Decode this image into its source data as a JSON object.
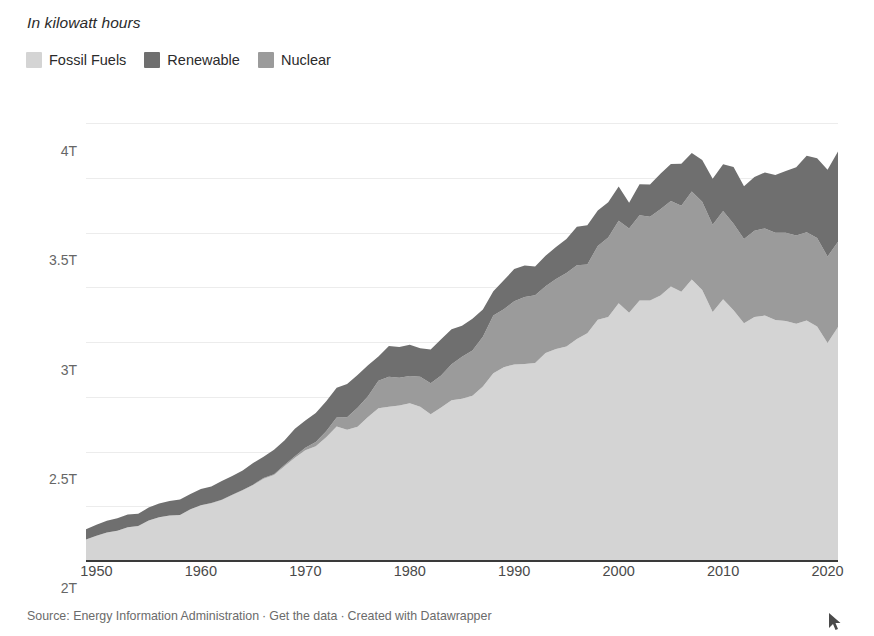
{
  "subtitle": "In kilowatt hours",
  "legend": {
    "items": [
      {
        "label": "Fossil Fuels",
        "color": "#d4d4d4"
      },
      {
        "label": "Renewable",
        "color": "#6f6f6f"
      },
      {
        "label": "Nuclear",
        "color": "#9b9b9b"
      }
    ]
  },
  "footer": {
    "source": "Source: Energy Information Administration",
    "sep1": "·",
    "get_data": "Get the data",
    "sep2": "·",
    "created": "Created with Datawrapper"
  },
  "cursor": {
    "name": "mouse-pointer"
  },
  "chart_data": {
    "type": "area",
    "stacked": true,
    "title": "",
    "subtitle": "In kilowatt hours",
    "xlabel": "",
    "ylabel": "",
    "xlim": [
      1949,
      2021
    ],
    "ylim": [
      0,
      4250000000000
    ],
    "grid": true,
    "legend_position": "top-left",
    "ytick_labels": [
      "0",
      "500B",
      "1T",
      "1.5T",
      "2T",
      "2.5T",
      "3T",
      "3.5T",
      "4T"
    ],
    "ytick_values": [
      0,
      500000000000,
      1000000000000,
      1500000000000,
      2000000000000,
      2500000000000,
      3000000000000,
      3500000000000,
      4000000000000
    ],
    "xtick_labels": [
      "1950",
      "1960",
      "1970",
      "1980",
      "1990",
      "2000",
      "2010",
      "2020"
    ],
    "xtick_values": [
      1950,
      1960,
      1970,
      1980,
      1990,
      2000,
      2010,
      2020
    ],
    "units": "kilowatt hours",
    "x": [
      1949,
      1950,
      1951,
      1952,
      1953,
      1954,
      1955,
      1956,
      1957,
      1958,
      1959,
      1960,
      1961,
      1962,
      1963,
      1964,
      1965,
      1966,
      1967,
      1968,
      1969,
      1970,
      1971,
      1972,
      1973,
      1974,
      1975,
      1976,
      1977,
      1978,
      1979,
      1980,
      1981,
      1982,
      1983,
      1984,
      1985,
      1986,
      1987,
      1988,
      1989,
      1990,
      1991,
      1992,
      1993,
      1994,
      1995,
      1996,
      1997,
      1998,
      1999,
      2000,
      2001,
      2002,
      2003,
      2004,
      2005,
      2006,
      2007,
      2008,
      2009,
      2010,
      2011,
      2012,
      2013,
      2014,
      2015,
      2016,
      2017,
      2018,
      2019,
      2020,
      2021
    ],
    "series": [
      {
        "name": "Fossil Fuels",
        "color": "#d4d4d4",
        "values": [
          196,
          231,
          260,
          276,
          308,
          320,
          371,
          401,
          415,
          420,
          472,
          509,
          528,
          558,
          603,
          646,
          694,
          752,
          786,
          866,
          944,
          1013,
          1049,
          1132,
          1229,
          1199,
          1228,
          1315,
          1397,
          1409,
          1421,
          1441,
          1410,
          1341,
          1402,
          1470,
          1483,
          1510,
          1594,
          1716,
          1771,
          1797,
          1800,
          1809,
          1901,
          1938,
          1960,
          2028,
          2082,
          2205,
          2229,
          2355,
          2269,
          2380,
          2382,
          2427,
          2508,
          2460,
          2572,
          2477,
          2275,
          2393,
          2292,
          2173,
          2229,
          2243,
          2202,
          2193,
          2169,
          2198,
          2144,
          1993,
          2139
        ]
      },
      {
        "name": "Nuclear",
        "color": "#9b9b9b",
        "values": [
          0,
          0,
          0,
          0,
          0,
          0,
          0,
          0,
          0,
          0,
          0,
          1,
          2,
          2,
          3,
          3,
          4,
          6,
          8,
          12,
          14,
          22,
          38,
          54,
          83,
          114,
          173,
          191,
          251,
          276,
          255,
          251,
          273,
          283,
          294,
          328,
          384,
          414,
          455,
          527,
          529,
          577,
          613,
          619,
          610,
          640,
          673,
          675,
          629,
          674,
          728,
          754,
          769,
          780,
          764,
          789,
          782,
          787,
          806,
          806,
          799,
          807,
          790,
          769,
          789,
          797,
          797,
          806,
          805,
          807,
          809,
          790,
          778
        ]
      },
      {
        "name": "Renewable",
        "color": "#6f6f6f",
        "values": [
          95,
          101,
          109,
          115,
          116,
          112,
          117,
          124,
          133,
          141,
          141,
          149,
          152,
          172,
          170,
          178,
          197,
          195,
          222,
          223,
          250,
          248,
          266,
          273,
          272,
          304,
          300,
          284,
          220,
          280,
          280,
          284,
          261,
          309,
          331,
          321,
          284,
          291,
          250,
          222,
          265,
          294,
          288,
          263,
          280,
          292,
          311,
          353,
          357,
          325,
          323,
          313,
          237,
          284,
          295,
          323,
          339,
          384,
          352,
          382,
          419,
          427,
          520,
          483,
          491,
          511,
          529,
          565,
          625,
          698,
          728,
          792,
          826
        ]
      }
    ],
    "value_scale": "billions of kWh",
    "total_peak": {
      "year": 2007,
      "value": 3730
    }
  }
}
